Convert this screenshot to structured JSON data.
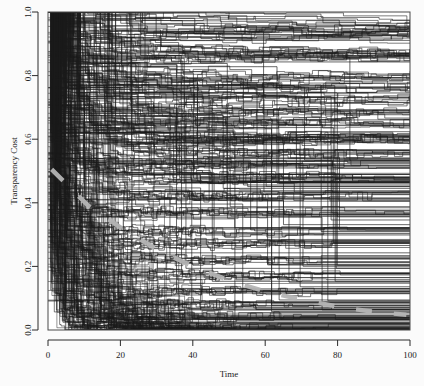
{
  "chart_data": {
    "type": "line",
    "title": "",
    "subtitle": "",
    "xlabel": "Time",
    "ylabel": "Transparency Cost",
    "xlim": [
      0,
      100
    ],
    "ylim": [
      0.0,
      1.0
    ],
    "xticks": [
      0,
      20,
      40,
      60,
      80,
      100
    ],
    "xtick_labels": [
      "0",
      "20",
      "40",
      "60",
      "80",
      "100"
    ],
    "yticks": [
      0.0,
      0.2,
      0.4,
      0.6,
      0.8,
      1.0
    ],
    "ytick_labels": [
      "0.0",
      "0.2",
      "0.4",
      "0.6",
      "0.8",
      "1.0"
    ],
    "grid": false,
    "legend": "none",
    "line_style": "step",
    "series_color": "#1c1c1c",
    "series_line_width": 0.7,
    "overlay": {
      "name": "mean-trend",
      "style": "dashed",
      "color": "#b4b4b4",
      "line_width": 4.5,
      "x": [
        1,
        11,
        21,
        31,
        41,
        51,
        61,
        71,
        81,
        91,
        99
      ],
      "y": [
        0.505,
        0.392,
        0.315,
        0.248,
        0.195,
        0.152,
        0.118,
        0.094,
        0.071,
        0.056,
        0.048
      ]
    },
    "series": [
      {
        "name": "path-1",
        "values": [
          1,
          0.99,
          0.99,
          0.99,
          0.98,
          0.98,
          0.97,
          0.96,
          0.96,
          0.95,
          0.95,
          0.95,
          0.95,
          0.95,
          0.95,
          0.95,
          0.95,
          0.95,
          0.95,
          0.95,
          0.95,
          0.95,
          0.95,
          0.95,
          0.95,
          0.95
        ]
      },
      {
        "name": "path-2",
        "values": [
          1,
          0.98,
          0.97,
          0.96,
          0.94,
          0.94,
          0.94,
          0.94,
          0.94,
          0.94,
          0.94,
          0.94,
          0.94,
          0.94,
          0.94,
          0.94,
          0.94,
          0.94,
          0.94,
          0.94,
          0.94,
          0.94,
          0.94,
          0.94,
          0.94,
          0.94
        ]
      },
      {
        "name": "path-3",
        "values": [
          1,
          0.97,
          0.93,
          0.93,
          0.93,
          0.93,
          0.93,
          0.93,
          0.93,
          0.93,
          0.93,
          0.93,
          0.93,
          0.93,
          0.93,
          0.93,
          0.93,
          0.93,
          0.93,
          0.93,
          0.93,
          0.93,
          0.93,
          0.93,
          0.93,
          0.93
        ]
      },
      {
        "name": "path-4",
        "values": [
          1,
          0.95,
          0.92,
          0.9,
          0.89,
          0.88,
          0.88,
          0.88,
          0.88,
          0.88,
          0.87,
          0.87,
          0.87,
          0.87,
          0.87,
          0.87,
          0.87,
          0.87,
          0.87,
          0.87,
          0.87,
          0.87,
          0.87,
          0.87,
          0.87,
          0.87
        ]
      },
      {
        "name": "path-5",
        "values": [
          1,
          0.94,
          0.9,
          0.87,
          0.86,
          0.86,
          0.86,
          0.86,
          0.86,
          0.86,
          0.86,
          0.86,
          0.86,
          0.86,
          0.86,
          0.86,
          0.86,
          0.86,
          0.86,
          0.86,
          0.86,
          0.86,
          0.86,
          0.86,
          0.86,
          0.86
        ]
      },
      {
        "name": "path-6",
        "values": [
          1,
          0.92,
          0.88,
          0.85,
          0.84,
          0.83,
          0.82,
          0.81,
          0.8,
          0.8,
          0.8,
          0.8,
          0.8,
          0.8,
          0.8,
          0.8,
          0.8,
          0.8,
          0.8,
          0.8,
          0.8,
          0.8,
          0.8,
          0.8,
          0.8,
          0.8
        ]
      },
      {
        "name": "path-7",
        "values": [
          1,
          0.9,
          0.85,
          0.82,
          0.8,
          0.78,
          0.77,
          0.77,
          0.77,
          0.77,
          0.77,
          0.77,
          0.77,
          0.77,
          0.77,
          0.77,
          0.77,
          0.77,
          0.77,
          0.77,
          0.77,
          0.77,
          0.77,
          0.77,
          0.77,
          0.77
        ]
      },
      {
        "name": "path-8",
        "values": [
          1,
          0.88,
          0.83,
          0.79,
          0.76,
          0.74,
          0.73,
          0.72,
          0.72,
          0.72,
          0.72,
          0.72,
          0.72,
          0.72,
          0.72,
          0.72,
          0.72,
          0.72,
          0.72,
          0.72,
          0.72,
          0.72,
          0.72,
          0.72,
          0.72,
          0.72
        ]
      },
      {
        "name": "path-9",
        "values": [
          1,
          0.86,
          0.8,
          0.75,
          0.72,
          0.7,
          0.69,
          0.68,
          0.68,
          0.68,
          0.68,
          0.68,
          0.68,
          0.68,
          0.68,
          0.68,
          0.68,
          0.68,
          0.68,
          0.68,
          0.68,
          0.68,
          0.68,
          0.68,
          0.68,
          0.68
        ]
      },
      {
        "name": "path-10",
        "values": [
          1,
          0.84,
          0.77,
          0.72,
          0.69,
          0.67,
          0.66,
          0.65,
          0.65,
          0.65,
          0.65,
          0.65,
          0.65,
          0.65,
          0.65,
          0.65,
          0.65,
          0.65,
          0.65,
          0.65,
          0.65,
          0.65,
          0.65,
          0.65,
          0.65,
          0.65
        ]
      },
      {
        "name": "path-11",
        "values": [
          1,
          0.82,
          0.74,
          0.69,
          0.66,
          0.64,
          0.63,
          0.62,
          0.61,
          0.61,
          0.61,
          0.61,
          0.61,
          0.61,
          0.61,
          0.61,
          0.61,
          0.61,
          0.61,
          0.61,
          0.61,
          0.61,
          0.61,
          0.61,
          0.61,
          0.61
        ]
      },
      {
        "name": "path-12",
        "values": [
          1,
          0.8,
          0.71,
          0.66,
          0.63,
          0.61,
          0.6,
          0.6,
          0.6,
          0.6,
          0.6,
          0.6,
          0.6,
          0.6,
          0.6,
          0.6,
          0.6,
          0.6,
          0.6,
          0.6,
          0.6,
          0.6,
          0.6,
          0.6,
          0.6,
          0.6
        ]
      },
      {
        "name": "path-13",
        "values": [
          1,
          0.78,
          0.68,
          0.62,
          0.59,
          0.57,
          0.56,
          0.55,
          0.55,
          0.55,
          0.55,
          0.55,
          0.55,
          0.55,
          0.55,
          0.55,
          0.55,
          0.55,
          0.55,
          0.55,
          0.55,
          0.55,
          0.55,
          0.55,
          0.55,
          0.55
        ]
      },
      {
        "name": "path-14",
        "values": [
          1,
          0.75,
          0.64,
          0.58,
          0.55,
          0.53,
          0.52,
          0.52,
          0.52,
          0.52,
          0.52,
          0.52,
          0.52,
          0.52,
          0.52,
          0.52,
          0.52,
          0.52,
          0.52,
          0.52,
          0.52,
          0.52,
          0.52,
          0.52,
          0.52,
          0.52
        ]
      },
      {
        "name": "path-15",
        "values": [
          1,
          0.72,
          0.61,
          0.55,
          0.51,
          0.49,
          0.48,
          0.48,
          0.48,
          0.48,
          0.48,
          0.48,
          0.48,
          0.48,
          0.48,
          0.48,
          0.48,
          0.48,
          0.48,
          0.48,
          0.48,
          0.48,
          0.48,
          0.48,
          0.48,
          0.48
        ]
      },
      {
        "name": "path-16",
        "values": [
          1,
          0.7,
          0.57,
          0.5,
          0.46,
          0.44,
          0.43,
          0.42,
          0.42,
          0.42,
          0.42,
          0.42,
          0.42,
          0.42,
          0.42,
          0.42,
          0.42,
          0.42,
          0.42,
          0.42,
          0.42,
          0.42,
          0.42,
          0.42,
          0.42,
          0.42
        ]
      },
      {
        "name": "path-17",
        "values": [
          1,
          0.66,
          0.53,
          0.45,
          0.41,
          0.39,
          0.38,
          0.37,
          0.37,
          0.37,
          0.37,
          0.37,
          0.37,
          0.37,
          0.37,
          0.37,
          0.37,
          0.37,
          0.37,
          0.37,
          0.37,
          0.37,
          0.37,
          0.37,
          0.37,
          0.37
        ]
      },
      {
        "name": "path-18",
        "values": [
          1,
          0.62,
          0.48,
          0.4,
          0.36,
          0.33,
          0.32,
          0.31,
          0.31,
          0.31,
          0.31,
          0.31,
          0.31,
          0.31,
          0.31,
          0.31,
          0.31,
          0.31,
          0.31,
          0.31,
          0.31,
          0.31,
          0.31,
          0.31,
          0.31,
          0.31
        ]
      },
      {
        "name": "path-19",
        "values": [
          1,
          0.58,
          0.43,
          0.35,
          0.3,
          0.28,
          0.27,
          0.27,
          0.27,
          0.27,
          0.27,
          0.27,
          0.27,
          0.27,
          0.27,
          0.27,
          0.27,
          0.27,
          0.27,
          0.27,
          0.27,
          0.27,
          0.27,
          0.27,
          0.27,
          0.27
        ]
      },
      {
        "name": "path-20",
        "values": [
          1,
          0.54,
          0.38,
          0.29,
          0.25,
          0.23,
          0.22,
          0.22,
          0.22,
          0.22,
          0.22,
          0.22,
          0.22,
          0.22,
          0.22,
          0.22,
          0.22,
          0.22,
          0.22,
          0.22,
          0.22,
          0.22,
          0.22,
          0.22,
          0.22,
          0.22
        ]
      },
      {
        "name": "path-21",
        "values": [
          1,
          0.5,
          0.33,
          0.24,
          0.2,
          0.18,
          0.17,
          0.17,
          0.17,
          0.17,
          0.17,
          0.17,
          0.17,
          0.17,
          0.17,
          0.17,
          0.17,
          0.17,
          0.17,
          0.17,
          0.17,
          0.17,
          0.17,
          0.17,
          0.17,
          0.17
        ]
      },
      {
        "name": "path-22",
        "values": [
          1,
          0.46,
          0.28,
          0.19,
          0.15,
          0.13,
          0.12,
          0.12,
          0.12,
          0.12,
          0.12,
          0.12,
          0.12,
          0.12,
          0.12,
          0.12,
          0.12,
          0.12,
          0.12,
          0.12,
          0.12,
          0.12,
          0.12,
          0.12,
          0.12,
          0.12
        ]
      },
      {
        "name": "path-23",
        "values": [
          1,
          0.4,
          0.22,
          0.14,
          0.1,
          0.09,
          0.08,
          0.08,
          0.08,
          0.08,
          0.08,
          0.08,
          0.08,
          0.08,
          0.08,
          0.08,
          0.08,
          0.08,
          0.08,
          0.08,
          0.08,
          0.08,
          0.08,
          0.08,
          0.08,
          0.08
        ]
      },
      {
        "name": "path-24",
        "values": [
          1,
          0.34,
          0.16,
          0.09,
          0.06,
          0.05,
          0.04,
          0.04,
          0.04,
          0.04,
          0.04,
          0.04,
          0.04,
          0.04,
          0.04,
          0.04,
          0.04,
          0.04,
          0.04,
          0.04,
          0.04,
          0.04,
          0.04,
          0.04,
          0.04,
          0.04
        ]
      },
      {
        "name": "path-25",
        "values": [
          1,
          0.26,
          0.1,
          0.05,
          0.03,
          0.02,
          0.01,
          0.01,
          0.01,
          0.01,
          0.01,
          0.01,
          0.01,
          0.01,
          0.01,
          0.01,
          0.01,
          0.01,
          0.01,
          0.01,
          0.01,
          0.01,
          0.01,
          0.01,
          0.01,
          0.01
        ]
      },
      {
        "name": "path-26",
        "values": [
          1,
          0.18,
          0.05,
          0.02,
          0.01,
          0,
          0,
          0,
          0,
          0,
          0,
          0,
          0,
          0,
          0,
          0,
          0,
          0,
          0,
          0,
          0,
          0,
          0,
          0,
          0,
          0
        ]
      }
    ]
  },
  "figure": {
    "background_color": "#fbfbfb",
    "plot_background_color": "#ffffff",
    "frame_color": "#4a4a4a",
    "axis_color": "#2b2b2b"
  }
}
